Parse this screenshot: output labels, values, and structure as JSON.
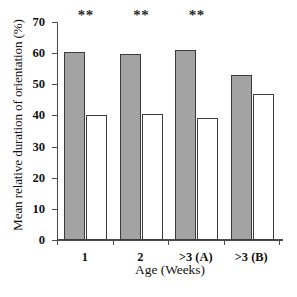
{
  "chart_data": {
    "type": "bar",
    "title": "",
    "subtitle": "",
    "xlabel": "Age (Weeks)",
    "ylabel": "Mean relative duration of orientation (%)",
    "categories": [
      "1",
      "2",
      ">3 (A)",
      ">3 (B)"
    ],
    "series": [
      {
        "name": "filled-gray",
        "fill": "#a3a3a3",
        "values": [
          60.3,
          59.7,
          61.0,
          53.0
        ]
      },
      {
        "name": "open-white",
        "fill": "#ffffff",
        "values": [
          40.0,
          40.5,
          39.2,
          47.0
        ]
      }
    ],
    "ylim": [
      0,
      70
    ],
    "yticks": [
      0,
      10,
      20,
      30,
      40,
      50,
      60,
      70
    ],
    "ytick_labels": [
      "0",
      "10",
      "20",
      "30",
      "40",
      "50",
      "60",
      "70"
    ],
    "grid": false,
    "legend": "none",
    "annotations": [
      {
        "category": "1",
        "text": "**"
      },
      {
        "category": "2",
        "text": "**"
      },
      {
        "category": ">3 (A)",
        "text": "**"
      },
      {
        "category": ">3 (B)",
        "text": ""
      }
    ],
    "colors": {
      "bar_fill": "#a3a3a3",
      "bar_edge": "#3b3b3b",
      "axis": "#4c4c4c",
      "text": "#111111",
      "background": "#ffffff"
    }
  }
}
